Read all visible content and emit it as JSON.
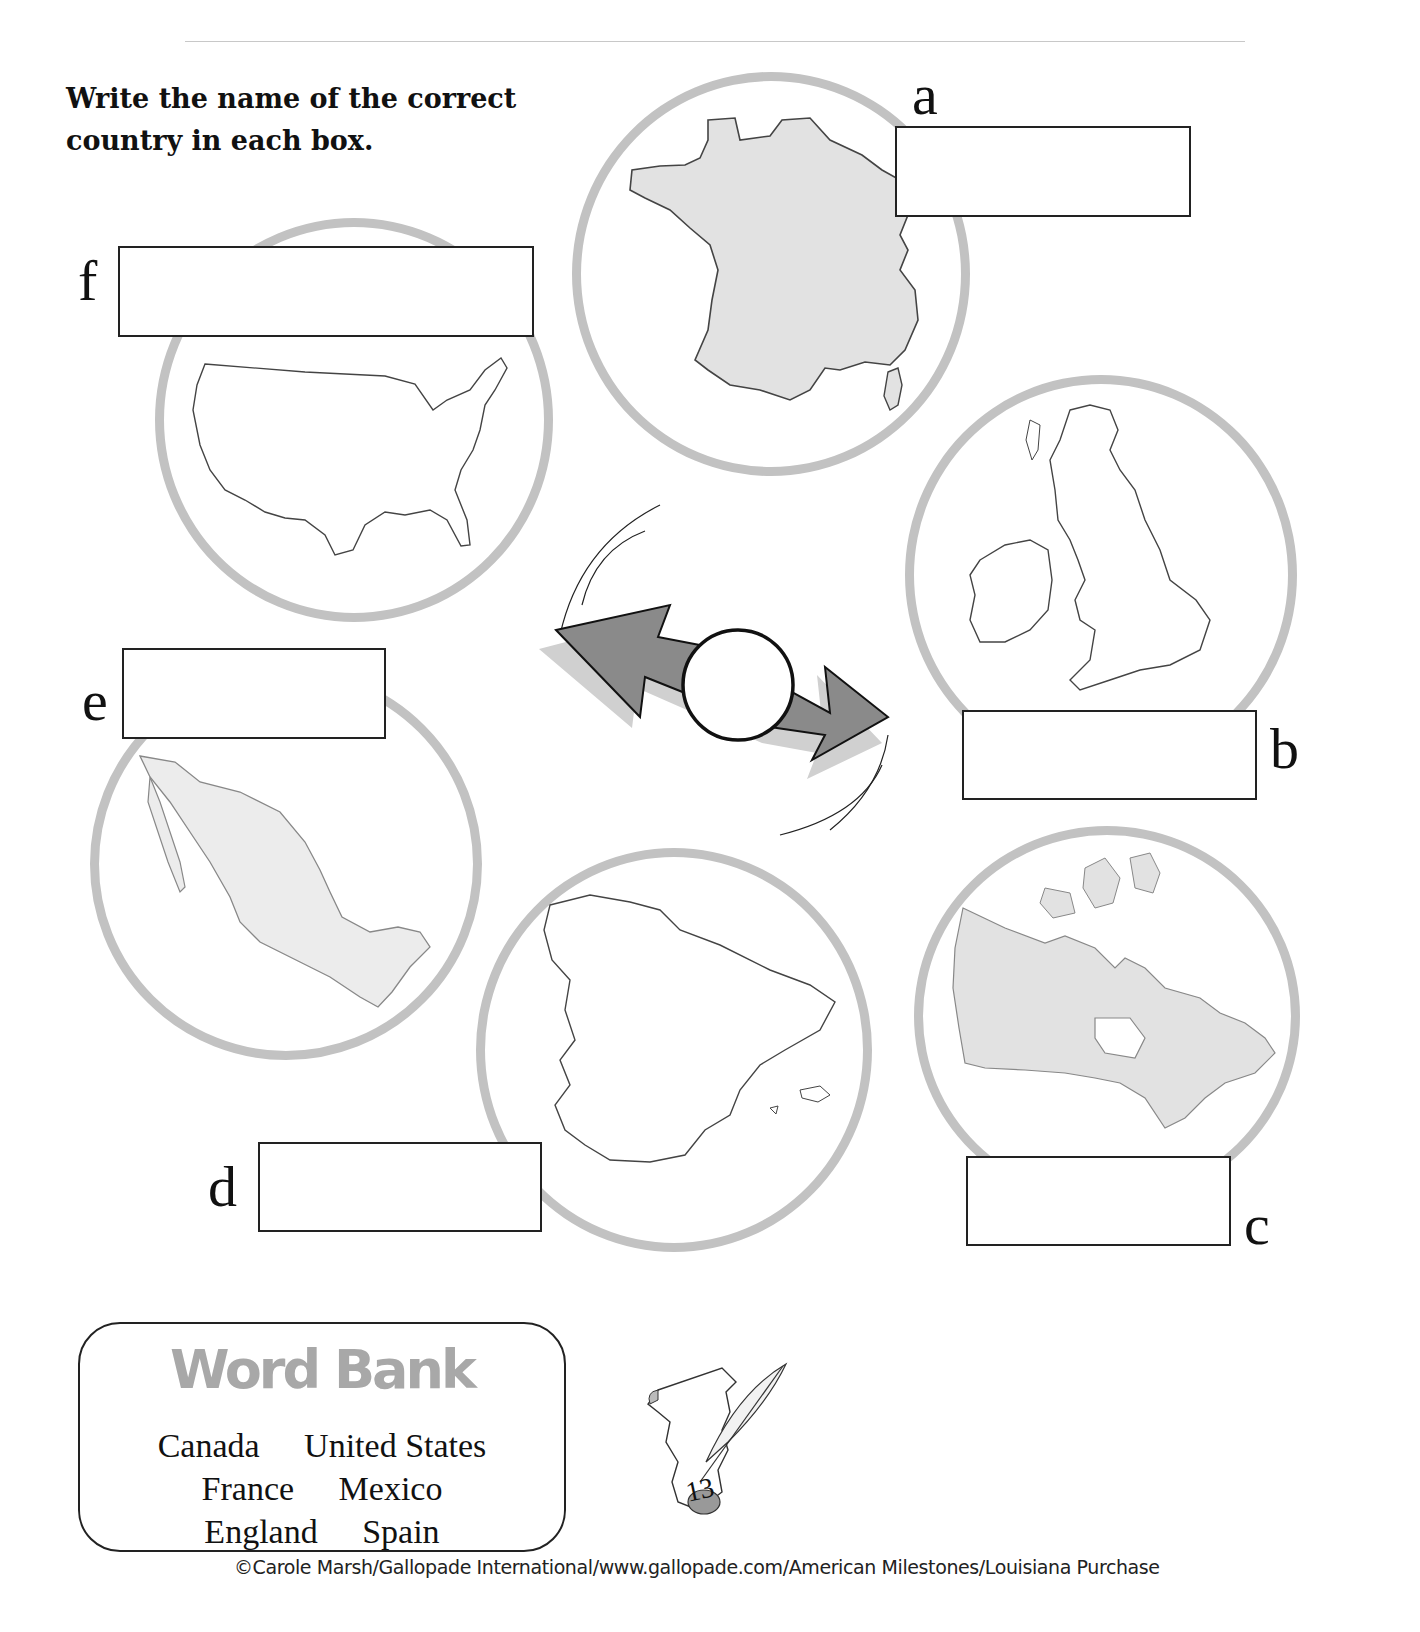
{
  "instructions": {
    "line1": "Write the name of the correct",
    "line2": "country in each box."
  },
  "items": [
    {
      "letter": "a",
      "map": "france-map",
      "answer": "",
      "placeholder": ""
    },
    {
      "letter": "b",
      "map": "england-map",
      "answer": "",
      "placeholder": ""
    },
    {
      "letter": "c",
      "map": "canada-map",
      "answer": "",
      "placeholder": ""
    },
    {
      "letter": "d",
      "map": "spain-map",
      "answer": "",
      "placeholder": ""
    },
    {
      "letter": "e",
      "map": "mexico-map",
      "answer": "",
      "placeholder": ""
    },
    {
      "letter": "f",
      "map": "united-states-map",
      "answer": "",
      "placeholder": ""
    }
  ],
  "word_bank": {
    "title": "Word Bank",
    "rows": [
      [
        "Canada",
        "United States"
      ],
      [
        "France",
        "Mexico"
      ],
      [
        "England",
        "Spain"
      ]
    ]
  },
  "page_number": "13",
  "footer": {
    "copyright": "©Carole Marsh/Gallopade International/www.gallopade.com/American Milestones/Louisiana Purchase"
  },
  "colors": {
    "globe_ring": "#c2c2c2",
    "map_fill": "#e2e2e2",
    "arrow_fill": "#8a8a8a",
    "word_bank_title": "#a8a8a8"
  }
}
